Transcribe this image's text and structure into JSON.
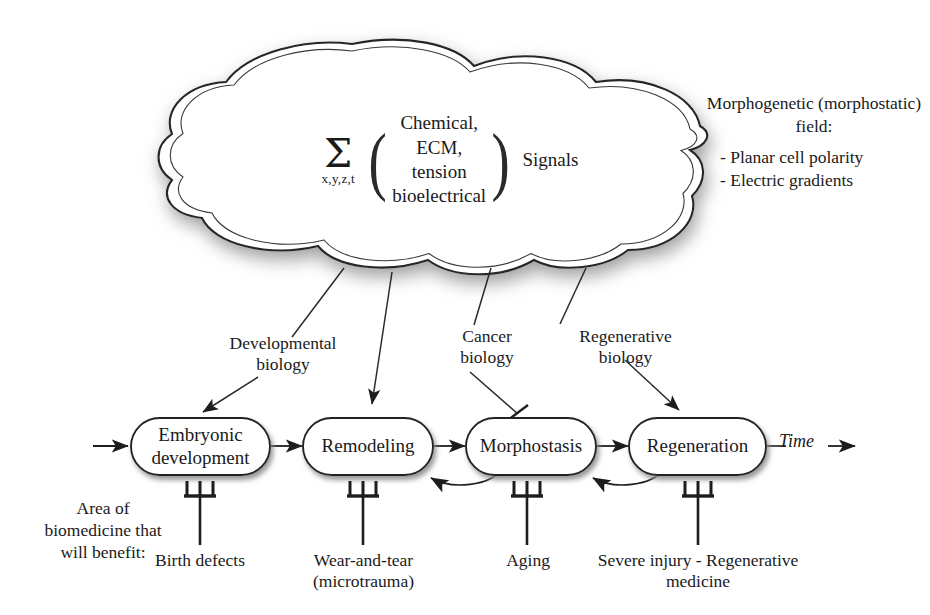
{
  "cloud": {
    "formula": {
      "sum_symbol": "Σ",
      "sum_subscript": "x,y,z,t",
      "left_paren": "(",
      "right_paren": ")",
      "terms": [
        "Chemical,",
        "ECM,",
        "tension",
        "bioelectrical"
      ],
      "trailing_word": "Signals"
    }
  },
  "field_note": {
    "title": "Morphogenetic\n(morphostatic)\nfield:",
    "bullets": [
      "- Planar cell polarity",
      "- Electric gradients"
    ]
  },
  "nodes": [
    {
      "id": "embryonic-development",
      "label": "Embryonic\ndevelopment"
    },
    {
      "id": "remodeling",
      "label": "Remodeling"
    },
    {
      "id": "morphostasis",
      "label": "Morphostasis"
    },
    {
      "id": "regeneration",
      "label": "Regeneration"
    }
  ],
  "branch_labels": [
    {
      "id": "developmental-biology",
      "label": "Developmental\nbiology",
      "target": "embryonic-development",
      "connector": "arrow"
    },
    {
      "id": "cancer-biology",
      "label": "Cancer\nbiology",
      "target": "morphostasis",
      "connector": "inhibition"
    },
    {
      "id": "regenerative-biology",
      "label": "Regenerative\nbiology",
      "target": "regeneration",
      "connector": "arrow"
    }
  ],
  "timeline": {
    "axis_label": "Time"
  },
  "benefit_note": {
    "text": "Area of\nbiomedicine\nthat will\nbenefit:"
  },
  "bottom_labels": [
    {
      "id": "birth-defects",
      "label": "Birth\ndefects",
      "node": "embryonic-development"
    },
    {
      "id": "wear-and-tear",
      "label": "Wear-and-tear\n(microtrauma)",
      "node": "remodeling"
    },
    {
      "id": "aging",
      "label": "Aging",
      "node": "morphostasis"
    },
    {
      "id": "severe-injury",
      "label": "Severe injury -\nRegenerative medicine",
      "node": "regeneration"
    }
  ],
  "colors": {
    "ink": "#231f20",
    "line": "#2a2a2a",
    "background": "#ffffff",
    "shadow": "#9a9a9a"
  }
}
